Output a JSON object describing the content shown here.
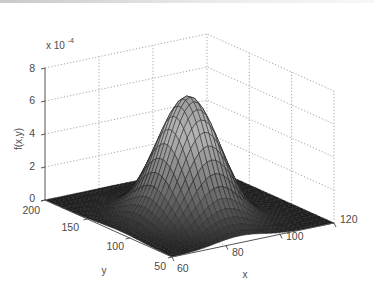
{
  "chart_data": {
    "type": "surface3d",
    "title": "",
    "xlabel": "x",
    "ylabel": "y",
    "zlabel": "f(x,y)",
    "z_multiplier": "x 10^-4",
    "z_multiplier_base": "x 10",
    "z_multiplier_exp": "-4",
    "xlim": [
      60,
      120
    ],
    "ylim": [
      50,
      200
    ],
    "zlim": [
      0,
      8
    ],
    "x_ticks": [
      "60",
      "80",
      "100",
      "120"
    ],
    "y_ticks": [
      "50",
      "100",
      "150",
      "200"
    ],
    "z_ticks": [
      "0",
      "2",
      "4",
      "6",
      "8"
    ],
    "grid": true,
    "colormap": "gray",
    "surface": {
      "shape": "bivariate gaussian bump",
      "peak_value": 7.5,
      "peak_units": "x 10^-4",
      "peak_x": 85,
      "peak_y": 110,
      "sigma_x": 9,
      "sigma_y": 25,
      "baseline": 0
    }
  }
}
